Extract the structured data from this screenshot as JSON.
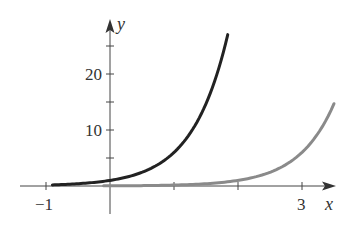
{
  "chart_data": {
    "type": "line",
    "title": "",
    "xlabel": "x",
    "ylabel": "y",
    "xlim": [
      -1.2,
      3.5
    ],
    "ylim": [
      -2,
      30
    ],
    "grid": false,
    "legend": null,
    "x_ticks": [
      -1,
      0,
      1,
      2,
      3
    ],
    "x_tick_labels": [
      "-1",
      "",
      "",
      "",
      "3"
    ],
    "y_ticks": [
      5,
      10,
      15,
      20,
      25
    ],
    "y_tick_labels": [
      "",
      "10",
      "",
      "20",
      ""
    ],
    "series": [
      {
        "name": "dark curve",
        "color": "#222222",
        "formula": "y = 6^x",
        "x": [
          -0.9,
          -0.5,
          0,
          0.5,
          1,
          1.25,
          1.5,
          1.75,
          1.84
        ],
        "y": [
          0.2,
          0.41,
          1,
          2.45,
          6,
          9.4,
          14.7,
          23,
          27
        ]
      },
      {
        "name": "gray curve",
        "color": "#8a8a8a",
        "formula": "y = 6^(x-2)",
        "x": [
          -0.1,
          0.5,
          1,
          1.5,
          2,
          2.5,
          3,
          3.25,
          3.5
        ],
        "y": [
          0.02,
          0.07,
          0.17,
          0.41,
          1,
          2.45,
          6,
          9.4,
          14.7
        ]
      }
    ]
  },
  "labels": {
    "x_axis": "x",
    "y_axis": "y",
    "tick_neg1": "−1",
    "tick_3": "3",
    "tick_10": "10",
    "tick_20": "20"
  }
}
